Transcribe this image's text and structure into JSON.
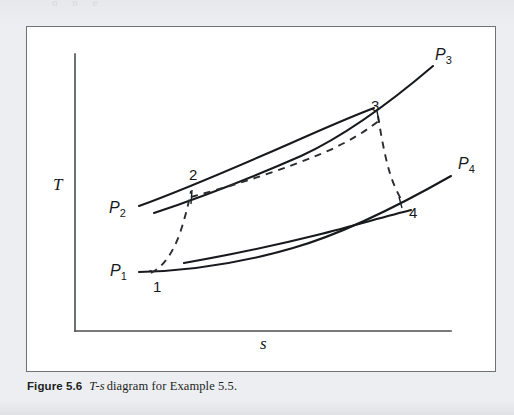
{
  "figure": {
    "caption_label": "Figure 5.6",
    "caption_ts": "T-s",
    "caption_rest": "diagram for Example 5.5.",
    "background_color": "#eceef1",
    "frame_color": "#6f7276",
    "paper_color": "#ffffff",
    "ink_color": "#17191c"
  },
  "page_remnant": {
    "text": "o  n  e"
  },
  "axes": {
    "y_label": "T",
    "x_label": "s",
    "y_axis": {
      "x": 74,
      "y_top": 53,
      "y_bottom": 330
    },
    "x_axis": {
      "y": 330,
      "x_left": 74,
      "x_right": 450
    },
    "y_label_pos": {
      "x": 52,
      "y": 189
    },
    "x_label_pos": {
      "x": 259,
      "y": 348
    }
  },
  "pressure_labels": [
    {
      "name": "P1",
      "base": "P",
      "sub": "1",
      "x": 109,
      "y": 275
    },
    {
      "name": "P2",
      "base": "P",
      "sub": "2",
      "x": 108,
      "y": 212
    },
    {
      "name": "P3",
      "base": "P",
      "sub": "3",
      "x": 434,
      "y": 59
    },
    {
      "name": "P4",
      "base": "P",
      "sub": "4",
      "x": 457,
      "y": 168
    }
  ],
  "state_points": [
    {
      "label": "1",
      "x": 152,
      "y": 291
    },
    {
      "label": "2",
      "x": 188,
      "y": 179
    },
    {
      "label": "3",
      "x": 370,
      "y": 110
    },
    {
      "label": "4",
      "x": 408,
      "y": 217
    }
  ],
  "chart_data": {
    "type": "line",
    "xlabel": "s",
    "ylabel": "T",
    "grid": false,
    "legend": "none",
    "axis_ranges": {
      "x": [
        74,
        450
      ],
      "y_pixels_top_to_bottom": [
        53,
        330
      ]
    },
    "note": "Thermodynamic temperature-entropy diagram showing four constant-pressure lines P1 < P2 and P3 > P4, with actual (dashed) and ideal (solid/vertical) process paths 1-2 (compression) and 3-4 (expansion).",
    "series": [
      {
        "name": "isobar-P2-upper",
        "style": "solid",
        "description": "upper constant-pressure line P2 (upper of the two high-pressure isobars), runs from lower-left up to the right ending below P3 region",
        "path": "M138,205 C185,188 240,164 288,143 C324,127 352,115 373,107"
      },
      {
        "name": "isobar-P3",
        "style": "solid",
        "description": "constant-pressure line P3, continues to upper right and terminates at label P3",
        "path": "M153,212 C198,197 252,176 300,155 C350,132 398,94 432,65"
      },
      {
        "name": "isobar-P1-lower",
        "style": "solid",
        "description": "lower constant-pressure line P1 starting at P1 label, sweeping right and up",
        "path": "M138,271 C186,270 240,262 292,247 C348,231 406,200 450,175"
      },
      {
        "name": "isobar-P4-lower-inner",
        "style": "solid",
        "description": "second lower constant-pressure line starting slightly right of P1 and ending before the right margin",
        "path": "M183,262 C228,254 272,245 316,234 C352,225 382,216 410,209"
      },
      {
        "name": "process-2-3-actual",
        "style": "dashed",
        "description": "dashed actual path between the two upper isobars from state 2 to state 3",
        "path": "M190,196 C238,183 284,168 322,152 C348,141 368,128 380,118"
      },
      {
        "name": "process-1-2-actual",
        "style": "dashed",
        "description": "dashed actual compression path from state 1 up to state 2",
        "path": "M150,272 C162,266 172,252 179,232 C185,214 188,200 190,190"
      },
      {
        "name": "process-3-4-actual",
        "style": "dashed",
        "description": "dashed actual expansion path from state 3 down to state 4",
        "path": "M377,115 C381,140 386,168 394,186 C397,193 399,196 400,198"
      }
    ],
    "tick_marks": [
      {
        "name": "state-2-tick",
        "x1": 191,
        "y1": 189,
        "x2": 190,
        "y2": 203
      },
      {
        "name": "state-3-tick",
        "x1": 376,
        "y1": 110,
        "x2": 378,
        "y2": 121
      },
      {
        "name": "state-4-tick",
        "x1": 398,
        "y1": 196,
        "x2": 401,
        "y2": 207
      },
      {
        "name": "state-1-dot",
        "x1": 148,
        "y1": 270,
        "x2": 151,
        "y2": 270
      }
    ]
  }
}
